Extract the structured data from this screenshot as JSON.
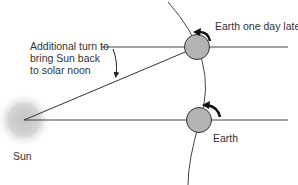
{
  "labels": {
    "annotation": "Additional turn to bring Sun back to solar noon",
    "earth_later": "Earth one day later",
    "earth": "Earth",
    "sun": "Sun"
  },
  "colors": {
    "earth_fill": "#b3b3b3",
    "line": "#333333",
    "sun_glow": "#c8c8c8",
    "background": "#ffffff"
  }
}
